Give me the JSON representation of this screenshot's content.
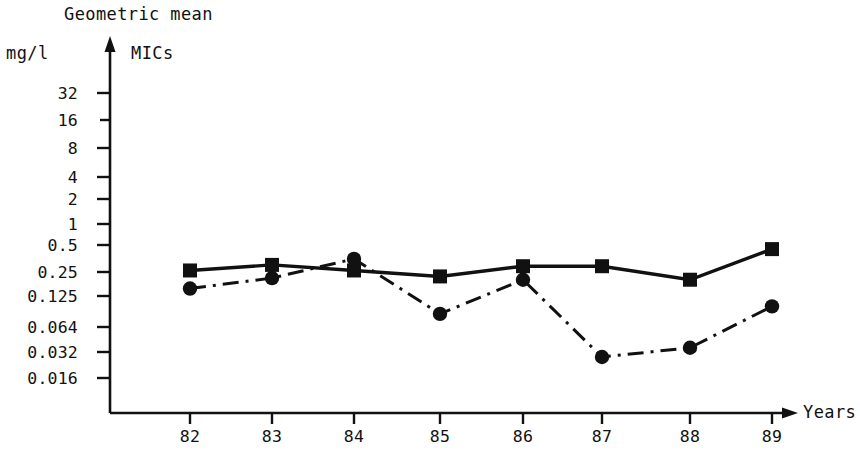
{
  "chart_data": {
    "type": "line",
    "title": "Geometric mean",
    "subtitle": "MICs",
    "ylabel": "mg/l",
    "xlabel": "Years",
    "categories": [
      "82",
      "83",
      "84",
      "85",
      "86",
      "87",
      "88",
      "89"
    ],
    "x_tick_labels": [
      "82",
      "83",
      "84",
      "85",
      "86",
      "87",
      "88",
      "89"
    ],
    "y_tick_labels": [
      "32",
      "16",
      "8",
      "4",
      "2",
      "1",
      "0.5",
      "0.25",
      "0.125",
      "0.064",
      "0.032",
      "0.016"
    ],
    "y_tick_values": [
      32,
      16,
      8,
      4,
      2,
      1,
      0.5,
      0.25,
      0.125,
      0.064,
      0.032,
      0.016
    ],
    "yscale": "log2",
    "ylim": [
      0.016,
      32
    ],
    "grid": false,
    "legend": "none",
    "series": [
      {
        "name": "solid-square-series",
        "marker": "square",
        "linestyle": "solid",
        "color": "#111111",
        "values": [
          0.26,
          0.3,
          0.26,
          0.22,
          0.29,
          0.29,
          0.2,
          0.45
        ]
      },
      {
        "name": "dashdot-circle-series",
        "marker": "circle",
        "linestyle": "dashdot",
        "color": "#111111",
        "values": [
          0.155,
          0.21,
          0.35,
          0.085,
          0.2,
          0.028,
          0.036,
          0.1
        ]
      }
    ]
  },
  "axes": {
    "y_axis_arrow": "up-arrow",
    "x_axis_arrow": "right-arrow"
  }
}
